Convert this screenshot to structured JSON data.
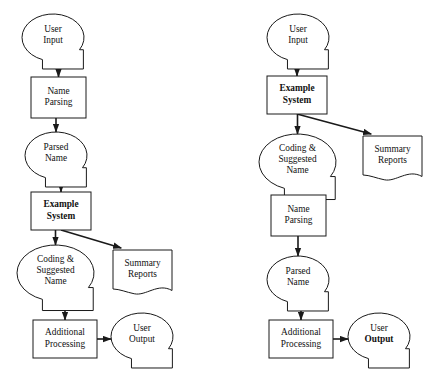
{
  "diagram": {
    "background_color": "#ffffff",
    "line_color": "#1a1a1a",
    "charts": [
      {
        "id": "left",
        "name": "left-flowchart",
        "nodes": [
          {
            "id": "l-user-input",
            "shape": "callout",
            "lines": [
              "User",
              "Input"
            ],
            "bold_lines": [],
            "x": 22,
            "y": 14,
            "w": 62,
            "h": 47
          },
          {
            "id": "l-name-parsing",
            "shape": "process",
            "lines": [
              "Name",
              "Parsing"
            ],
            "bold_lines": [],
            "x": 31,
            "y": 77,
            "w": 55,
            "h": 41
          },
          {
            "id": "l-parsed-name",
            "shape": "callout",
            "lines": [
              "Parsed",
              "Name"
            ],
            "bold_lines": [],
            "x": 25,
            "y": 132,
            "w": 62,
            "h": 47
          },
          {
            "id": "l-example-sys",
            "shape": "process",
            "lines": [
              "Example",
              "System"
            ],
            "bold_lines": [
              0,
              1
            ],
            "x": 31,
            "y": 192,
            "w": 60,
            "h": 38
          },
          {
            "id": "l-coding",
            "shape": "callout",
            "lines": [
              "Coding &",
              "Suggested",
              "Name"
            ],
            "bold_lines": [],
            "x": 17,
            "y": 245,
            "w": 77,
            "h": 56
          },
          {
            "id": "l-summary",
            "shape": "document",
            "lines": [
              "Summary",
              "Reports"
            ],
            "bold_lines": [],
            "x": 113,
            "y": 250,
            "w": 59,
            "h": 42
          },
          {
            "id": "l-additional",
            "shape": "process",
            "lines": [
              "Additional",
              "Processing"
            ],
            "bold_lines": [],
            "x": 33,
            "y": 320,
            "w": 64,
            "h": 38
          },
          {
            "id": "l-user-output",
            "shape": "callout",
            "lines": [
              "User",
              "Output"
            ],
            "bold_lines": [],
            "x": 111,
            "y": 313,
            "w": 62,
            "h": 47
          }
        ],
        "edges": [
          {
            "id": "l-e1",
            "from": "l-user-input",
            "to": "l-name-parsing",
            "kind": "vertical",
            "arrow": true
          },
          {
            "id": "l-e2",
            "from": "l-name-parsing",
            "to": "l-parsed-name",
            "kind": "vertical",
            "arrow": true
          },
          {
            "id": "l-e3",
            "from": "l-parsed-name",
            "to": "l-example-sys",
            "kind": "vertical",
            "arrow": true
          },
          {
            "id": "l-e4",
            "from": "l-example-sys",
            "to": "l-coding",
            "kind": "vertical",
            "arrow": true
          },
          {
            "id": "l-e5",
            "from": "l-example-sys",
            "to": "l-summary",
            "kind": "diagonal",
            "arrow": true
          },
          {
            "id": "l-e6",
            "from": "l-coding",
            "to": "l-additional",
            "kind": "vertical",
            "arrow": true
          },
          {
            "id": "l-e7",
            "from": "l-additional",
            "to": "l-user-output",
            "kind": "horizontal",
            "arrow": true
          }
        ]
      },
      {
        "id": "right",
        "name": "right-flowchart",
        "nodes": [
          {
            "id": "r-user-input",
            "shape": "callout",
            "lines": [
              "User",
              "Input"
            ],
            "bold_lines": [],
            "x": 267,
            "y": 14,
            "w": 62,
            "h": 47
          },
          {
            "id": "r-example-sys",
            "shape": "process",
            "lines": [
              "Example",
              "System"
            ],
            "bold_lines": [
              0,
              1
            ],
            "x": 267,
            "y": 76,
            "w": 60,
            "h": 38
          },
          {
            "id": "r-coding",
            "shape": "callout",
            "lines": [
              "Coding &",
              "Suggested",
              "Name"
            ],
            "bold_lines": [],
            "x": 259,
            "y": 134,
            "w": 77,
            "h": 56
          },
          {
            "id": "r-summary",
            "shape": "document",
            "lines": [
              "Summary",
              "Reports"
            ],
            "bold_lines": [],
            "x": 363,
            "y": 136,
            "w": 59,
            "h": 42
          },
          {
            "id": "r-name-parsing",
            "shape": "process",
            "lines": [
              "Name",
              "Parsing"
            ],
            "bold_lines": [],
            "x": 271,
            "y": 195,
            "w": 55,
            "h": 41
          },
          {
            "id": "r-parsed-name",
            "shape": "callout",
            "lines": [
              "Parsed",
              "Name"
            ],
            "bold_lines": [],
            "x": 267,
            "y": 256,
            "w": 62,
            "h": 47
          },
          {
            "id": "r-additional",
            "shape": "process",
            "lines": [
              "Additional",
              "Processing"
            ],
            "bold_lines": [],
            "x": 269,
            "y": 320,
            "w": 64,
            "h": 38
          },
          {
            "id": "r-user-output",
            "shape": "callout",
            "lines": [
              "User",
              "Output"
            ],
            "bold_lines": [
              1
            ],
            "x": 348,
            "y": 313,
            "w": 62,
            "h": 47
          }
        ],
        "edges": [
          {
            "id": "r-e1",
            "from": "r-user-input",
            "to": "r-example-sys",
            "kind": "vertical",
            "arrow": true
          },
          {
            "id": "r-e2",
            "from": "r-example-sys",
            "to": "r-coding",
            "kind": "vertical",
            "arrow": true
          },
          {
            "id": "r-e3",
            "from": "r-example-sys",
            "to": "r-summary",
            "kind": "diagonal",
            "arrow": true
          },
          {
            "id": "r-e4",
            "from": "r-coding",
            "to": "r-name-parsing",
            "kind": "vertical",
            "arrow": true
          },
          {
            "id": "r-e5",
            "from": "r-name-parsing",
            "to": "r-parsed-name",
            "kind": "vertical",
            "arrow": true
          },
          {
            "id": "r-e6",
            "from": "r-parsed-name",
            "to": "r-additional",
            "kind": "vertical",
            "arrow": true
          },
          {
            "id": "r-e7",
            "from": "r-additional",
            "to": "r-user-output",
            "kind": "horizontal",
            "arrow": true
          }
        ]
      }
    ]
  }
}
